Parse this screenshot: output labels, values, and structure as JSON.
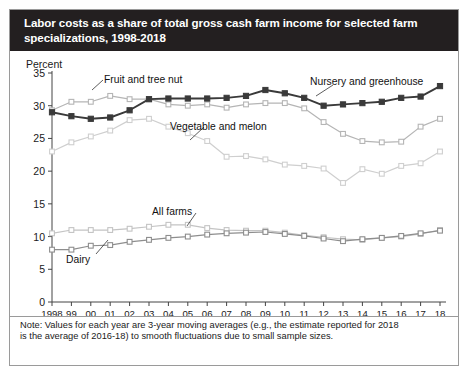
{
  "title": {
    "line1": "Labor costs as a share of total gross cash farm income for selected farm",
    "line2": "specializations, 1998-2018"
  },
  "axis": {
    "ylabel": "Percent",
    "yticks": [
      0,
      5,
      10,
      15,
      20,
      25,
      30,
      35
    ],
    "xticklabels": [
      "1998",
      "99",
      "00",
      "01",
      "02",
      "03",
      "04",
      "05",
      "06",
      "07",
      "08",
      "09",
      "10",
      "11",
      "12",
      "13",
      "14",
      "15",
      "16",
      "17",
      "18"
    ]
  },
  "annotations": {
    "fruit": "Fruit and tree nut",
    "nursery": "Nursery and greenhouse",
    "vegetable": "Vegetable and melon",
    "allfarms": "All farms",
    "dairy": "Dairy"
  },
  "note": {
    "line1": "Note: Values for each year are 3-year moving averages (e.g., the estimate reported for 2018",
    "line2": "is the average of 2016-18) to smooth fluctuations due to small sample sizes."
  },
  "colors": {
    "nursery": "#3a3a3a",
    "fruit": "#b5b5b5",
    "vegetable": "#cfcfcf",
    "allfarms": "#c4c4c4",
    "dairy": "#8e8e8e",
    "title_bg": "#231f20",
    "frame": "#9a9a9a"
  },
  "chart_data": {
    "type": "line",
    "title": "Labor costs as a share of total gross cash farm income for selected farm specializations, 1998-2018",
    "xlabel": "",
    "ylabel": "Percent",
    "ylim": [
      0,
      35
    ],
    "grid": false,
    "legend": "inline-annotations",
    "x": [
      1998,
      1999,
      2000,
      2001,
      2002,
      2003,
      2004,
      2005,
      2006,
      2007,
      2008,
      2009,
      2010,
      2011,
      2012,
      2013,
      2014,
      2015,
      2016,
      2017,
      2018
    ],
    "categories": [
      "1998",
      "99",
      "00",
      "01",
      "02",
      "03",
      "04",
      "05",
      "06",
      "07",
      "08",
      "09",
      "10",
      "11",
      "12",
      "13",
      "14",
      "15",
      "16",
      "17",
      "18"
    ],
    "series": [
      {
        "name": "Nursery and greenhouse",
        "color": "#3a3a3a",
        "values": [
          29.0,
          28.4,
          28.0,
          28.2,
          29.3,
          31.0,
          31.1,
          31.1,
          31.1,
          31.2,
          31.5,
          32.4,
          31.9,
          31.2,
          30.0,
          30.2,
          30.4,
          30.6,
          31.2,
          31.4,
          33.0
        ]
      },
      {
        "name": "Fruit and tree nut",
        "color": "#b5b5b5",
        "values": [
          29.3,
          30.6,
          30.6,
          31.5,
          31.0,
          31.0,
          30.2,
          30.0,
          30.2,
          29.7,
          30.2,
          30.4,
          30.4,
          29.6,
          27.5,
          25.7,
          24.6,
          24.4,
          24.5,
          26.8,
          28.0
        ]
      },
      {
        "name": "Vegetable and melon",
        "color": "#cfcfcf",
        "values": [
          23.0,
          24.4,
          25.3,
          26.2,
          27.8,
          28.0,
          26.8,
          25.8,
          24.6,
          22.2,
          22.3,
          21.8,
          21.0,
          20.8,
          20.4,
          18.2,
          20.3,
          19.6,
          20.8,
          21.2,
          23.0
        ]
      },
      {
        "name": "All farms",
        "color": "#c4c4c4",
        "values": [
          10.5,
          11.0,
          11.0,
          11.0,
          11.2,
          11.5,
          11.8,
          11.8,
          11.3,
          11.0,
          10.9,
          10.9,
          10.6,
          10.2,
          9.9,
          9.6,
          9.5,
          9.8,
          10.0,
          10.4,
          11.0
        ]
      },
      {
        "name": "Dairy",
        "color": "#8e8e8e",
        "values": [
          8.0,
          8.0,
          8.6,
          8.7,
          9.2,
          9.5,
          9.8,
          10.0,
          10.3,
          10.5,
          10.6,
          10.7,
          10.4,
          10.1,
          9.7,
          9.3,
          9.6,
          9.8,
          10.1,
          10.5,
          10.9
        ]
      }
    ]
  }
}
